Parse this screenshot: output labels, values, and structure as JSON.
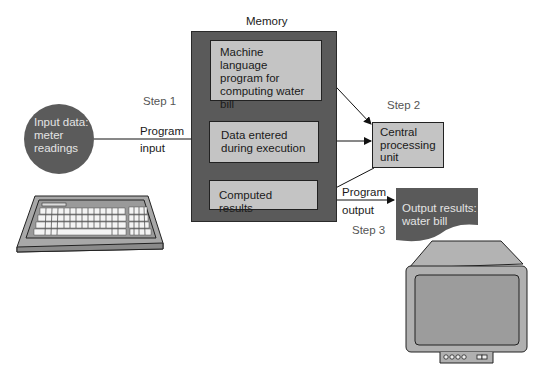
{
  "diagram": {
    "memory": {
      "title": "Memory",
      "program_box": {
        "line1": "Machine language",
        "line2": "program for",
        "line3": "computing water",
        "line4": "bill"
      },
      "data_box": {
        "line1": "Data entered",
        "line2": "during execution"
      },
      "results_box": {
        "label": "Computed results"
      }
    },
    "cpu": {
      "line1": "Central",
      "line2": "processing",
      "line3": "unit"
    },
    "input": {
      "line1": "Input data:",
      "line2": "meter",
      "line3": "readings"
    },
    "output": {
      "line1": "Output results:",
      "line2": "water bill"
    },
    "steps": {
      "step1": "Step 1",
      "step2": "Step 2",
      "step3": "Step 3"
    },
    "edge_labels": {
      "program_input_1": "Program",
      "program_input_2": "input",
      "program_output_1": "Program",
      "program_output_2": "output"
    },
    "colors": {
      "dark_fill": "#5a5a5a",
      "light_fill": "#c4c4c4",
      "device_fill": "#b0b0b0",
      "text_muted": "#555555"
    }
  }
}
